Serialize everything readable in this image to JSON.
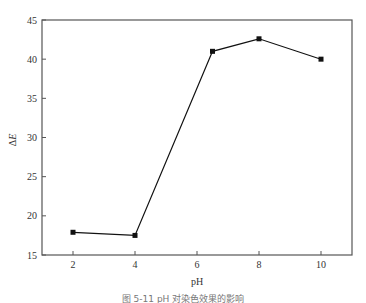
{
  "chart_data": {
    "type": "line",
    "title": "",
    "xlabel": "pH",
    "ylabel": "ΔE",
    "x": [
      2,
      4,
      6.5,
      8,
      10
    ],
    "series": [
      {
        "name": "ΔE",
        "values": [
          17.9,
          17.5,
          41.0,
          42.6,
          40.0
        ],
        "marker": "square",
        "color": "#111111"
      }
    ],
    "xlim": [
      0.5,
      11
    ],
    "ylim": [
      15,
      45
    ],
    "xticks": [
      2,
      4,
      6,
      8,
      10
    ],
    "yticks": [
      15,
      20,
      25,
      30,
      35,
      40,
      45
    ],
    "grid": false,
    "legend": null
  },
  "labels": {
    "xlabel": "pH",
    "ylabel_prefix": "Δ",
    "ylabel_var": "E",
    "caption": "图 5-11 pH 对染色效果的影响"
  },
  "ticks": {
    "x": [
      "2",
      "4",
      "6",
      "8",
      "10"
    ],
    "y": [
      "15",
      "20",
      "25",
      "30",
      "35",
      "40",
      "45"
    ]
  }
}
